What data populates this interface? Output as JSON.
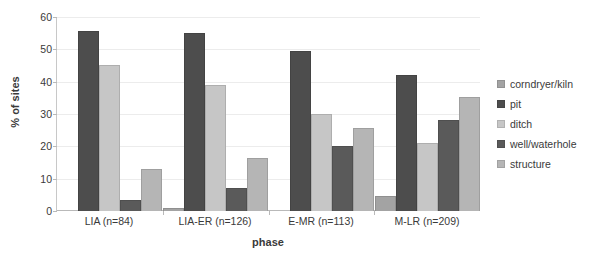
{
  "chart_data": {
    "type": "bar",
    "title": "",
    "xlabel": "phase",
    "ylabel": "% of sites",
    "ylim": [
      0,
      60
    ],
    "yticks": [
      0,
      10,
      20,
      30,
      40,
      50,
      60
    ],
    "grid": true,
    "legend_position": "right",
    "categories": [
      "LIA (n=84)",
      "LIA-ER (n=126)",
      "E-MR (n=113)",
      "M-LR (n=209)"
    ],
    "series": [
      {
        "name": "corndryer/kiln",
        "color": "#a3a3a3",
        "values": [
          0,
          0.8,
          0,
          4.6
        ]
      },
      {
        "name": "pit",
        "color": "#4d4d4d",
        "values": [
          55.8,
          55.2,
          49.5,
          42.2
        ]
      },
      {
        "name": "ditch",
        "color": "#c6c6c6",
        "values": [
          45.2,
          39.0,
          30.1,
          20.9
        ]
      },
      {
        "name": "well/waterhole",
        "color": "#5a5a5a",
        "values": [
          3.5,
          7.0,
          20.2,
          28.1
        ]
      },
      {
        "name": "structure",
        "color": "#b5b5b5",
        "values": [
          13.0,
          16.5,
          25.8,
          35.3
        ]
      }
    ]
  }
}
